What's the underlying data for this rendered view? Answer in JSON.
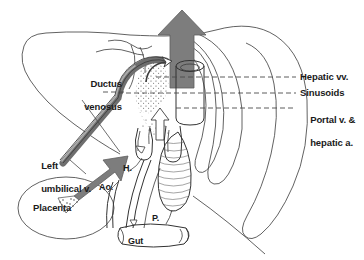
{
  "diagram": {
    "background_color": "#ffffff",
    "ink_color": "#333333",
    "arrow_fill_color": "#7d7d7d",
    "vessel_fill_color": "#6e6e6e",
    "width": 364,
    "height": 260
  },
  "labels": {
    "ductus_venosus_line1": "Ductus",
    "ductus_venosus_line2": "venosus",
    "left_umbilical_line1": "Left",
    "left_umbilical_line2": "umbilical v.",
    "placenta": "Placenta",
    "hepatic_vv": "Hepatic vv.",
    "sinusoids": "Sinusoids",
    "portal_line1": "Portal v. &",
    "portal_line2": "hepatic a.",
    "hepatic_abbr": "H.",
    "aorta_abbr": "Ao.",
    "portal_abbr": "P.",
    "gut": "Gut"
  },
  "icons": {
    "heart_flow_arrow": "up-arrow-icon",
    "umbilical_flow_arrow": "diagonal-arrow-icon",
    "sinusoid_outflow_arrow": "curved-arrow-icon",
    "sinusoid_inflow_arrow": "curved-arrow-icon"
  }
}
